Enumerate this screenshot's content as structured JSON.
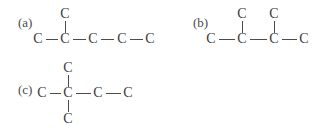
{
  "figure": {
    "kind": "organic-structural-formulas",
    "background_color": "#ffffff",
    "atom_color": "#3b3b3b",
    "bond_color": "#4b4b4b",
    "atom_symbol": "C",
    "bond_symbol": "—"
  },
  "structures": [
    {
      "id": "a",
      "label": "(a)",
      "main_chain_atoms": [
        "C",
        "C",
        "C",
        "C",
        "C"
      ],
      "branches": [
        {
          "attached_to_index": 1,
          "direction": "up",
          "atoms": [
            "C"
          ]
        }
      ]
    },
    {
      "id": "b",
      "label": "(b)",
      "main_chain_atoms": [
        "C",
        "C",
        "C",
        "C"
      ],
      "branches": [
        {
          "attached_to_index": 1,
          "direction": "up",
          "atoms": [
            "C"
          ]
        },
        {
          "attached_to_index": 2,
          "direction": "up",
          "atoms": [
            "C"
          ]
        }
      ]
    },
    {
      "id": "c",
      "label": "(c)",
      "main_chain_atoms": [
        "C",
        "C",
        "C",
        "C"
      ],
      "branches": [
        {
          "attached_to_index": 1,
          "direction": "up",
          "atoms": [
            "C"
          ]
        },
        {
          "attached_to_index": 1,
          "direction": "down",
          "atoms": [
            "C"
          ]
        }
      ]
    }
  ]
}
